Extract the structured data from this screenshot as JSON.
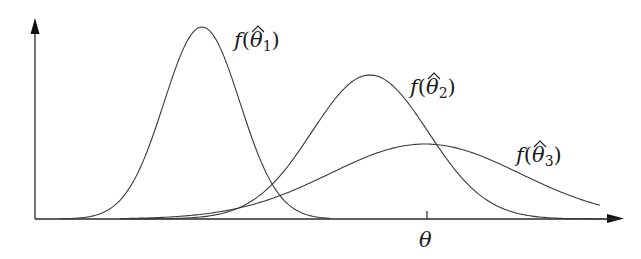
{
  "diagram": {
    "axes": {
      "x_arrow": true,
      "y_arrow": true
    },
    "curves": [
      {
        "id": "theta1",
        "label": "f(θ̂1)",
        "peak_x": 202,
        "peak_y": 27,
        "sigma": 38
      },
      {
        "id": "theta2",
        "label": "f(θ̂2)",
        "peak_x": 370,
        "peak_y": 75,
        "sigma": 58
      },
      {
        "id": "theta3",
        "label": "f(θ̂3)",
        "peak_x": 425,
        "peak_y": 144,
        "sigma": 95
      }
    ],
    "labels": {
      "f": "f",
      "lparen": "(",
      "rparen": ")",
      "theta": "θ",
      "sub1": "1",
      "sub2": "2",
      "sub3": "3",
      "x_tick_label": "θ"
    },
    "colors": {
      "stroke": "#3a3a3a",
      "axis": "#2a2a2a"
    }
  }
}
